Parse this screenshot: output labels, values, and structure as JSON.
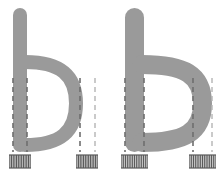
{
  "figure": {
    "background_color": "#ffffff",
    "glyph_color": "#9a9a9a",
    "guide_color": "#6e6e6e",
    "guide_faint_color": "#b4b4b4",
    "hatch_color": "#5a5a5a",
    "width": 223,
    "height": 173
  },
  "specimens": [
    {
      "id": "specimen-left",
      "character": "b",
      "weight_label": "regular",
      "stem_stroke_width": 14,
      "bowl_stroke_width": 14,
      "x_offset": 0,
      "guides": [
        {
          "name": "stem-left-edge",
          "x": 13,
          "y1": 78,
          "y2": 152,
          "style": "solid-dash"
        },
        {
          "name": "stem-right-edge",
          "x": 27,
          "y1": 78,
          "y2": 152,
          "style": "solid-dash"
        },
        {
          "name": "bowl-inner-right-edge",
          "x": 80,
          "y1": 78,
          "y2": 152,
          "style": "solid-dash"
        },
        {
          "name": "bowl-outer-right-edge",
          "x": 95,
          "y1": 78,
          "y2": 152,
          "style": "faint-dash"
        }
      ],
      "hatch_zones": [
        {
          "name": "stem-width-hatch-left",
          "x1": 9,
          "x2": 31,
          "y_top": 155,
          "y_bottom": 168,
          "line_count": 13
        },
        {
          "name": "bowl-width-hatch-right",
          "x1": 76,
          "x2": 98,
          "y_top": 155,
          "y_bottom": 168,
          "line_count": 13
        }
      ]
    },
    {
      "id": "specimen-right",
      "character": "b",
      "weight_label": "bold",
      "stem_stroke_width": 19,
      "bowl_stroke_width": 19,
      "x_offset": 112,
      "guides": [
        {
          "name": "stem-left-edge",
          "x": 125,
          "y1": 78,
          "y2": 152,
          "style": "solid-dash"
        },
        {
          "name": "stem-right-edge",
          "x": 144,
          "y1": 78,
          "y2": 152,
          "style": "solid-dash"
        },
        {
          "name": "bowl-inner-right-edge",
          "x": 193,
          "y1": 78,
          "y2": 152,
          "style": "solid-dash"
        },
        {
          "name": "bowl-outer-right-edge",
          "x": 212,
          "y1": 78,
          "y2": 152,
          "style": "faint-dash"
        }
      ],
      "hatch_zones": [
        {
          "name": "stem-width-hatch-left",
          "x1": 121,
          "x2": 148,
          "y_top": 155,
          "y_bottom": 168,
          "line_count": 15
        },
        {
          "name": "bowl-width-hatch-right",
          "x1": 189,
          "x2": 216,
          "y_top": 155,
          "y_bottom": 168,
          "line_count": 15
        }
      ]
    }
  ]
}
